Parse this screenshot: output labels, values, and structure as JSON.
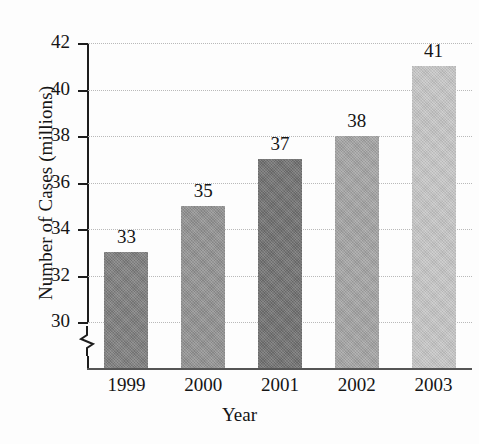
{
  "chart_data": {
    "type": "bar",
    "title": "",
    "xlabel": "Year",
    "ylabel": "Number of Cases (millions)",
    "categories": [
      "1999",
      "2000",
      "2001",
      "2002",
      "2003"
    ],
    "values": [
      33,
      35,
      37,
      38,
      41
    ],
    "value_labels": [
      "33",
      "35",
      "37",
      "38",
      "41"
    ],
    "series": [
      {
        "name": "Number of Cases (millions)",
        "values": [
          33,
          35,
          37,
          38,
          41
        ]
      }
    ],
    "ylim": [
      30,
      42
    ],
    "y_ticks": [
      30,
      32,
      34,
      36,
      38,
      40,
      42
    ],
    "y_tick_labels": [
      "30",
      "32",
      "34",
      "36",
      "38",
      "40",
      "42"
    ],
    "grid": true,
    "grid_axis": "y",
    "legend": "none",
    "axis_break": true,
    "axis_break_note": "y-axis broken below 30",
    "bar_colors": [
      "#7d7d7d",
      "#919191",
      "#6f6f6f",
      "#a3a3a3",
      "#c6c6c6"
    ]
  },
  "axes": {
    "y_title": "Number of Cases (millions)",
    "x_title": "Year"
  }
}
